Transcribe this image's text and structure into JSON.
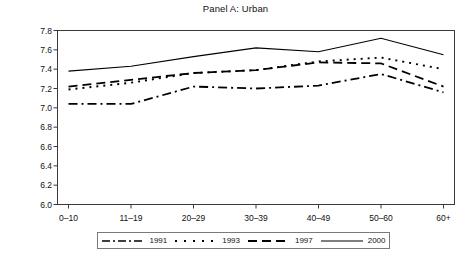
{
  "chart_data": {
    "type": "line",
    "title": "Panel A: Urban",
    "xlabel": "",
    "ylabel": "",
    "ylim": [
      6.0,
      7.8
    ],
    "yticks": [
      "6.0",
      "6.2",
      "6.4",
      "6.6",
      "6.8",
      "7.0",
      "7.2",
      "7.4",
      "7.6",
      "7.8"
    ],
    "grid": false,
    "legend_position": "bottom",
    "categories": [
      "0–10",
      "11–19",
      "20–29",
      "30–39",
      "40–49",
      "50–60",
      "60+"
    ],
    "series": [
      {
        "name": "1991",
        "style": "dash-dot",
        "color": "#000000",
        "values": [
          7.04,
          7.04,
          7.22,
          7.2,
          7.23,
          7.35,
          7.16
        ]
      },
      {
        "name": "1993",
        "style": "dotted",
        "color": "#000000",
        "values": [
          7.19,
          7.26,
          7.36,
          7.39,
          7.48,
          7.52,
          7.4
        ]
      },
      {
        "name": "1997",
        "style": "dashed",
        "color": "#000000",
        "values": [
          7.22,
          7.29,
          7.36,
          7.39,
          7.47,
          7.46,
          7.22
        ]
      },
      {
        "name": "2000",
        "style": "solid",
        "color": "#000000",
        "values": [
          7.38,
          7.43,
          7.53,
          7.62,
          7.58,
          7.72,
          7.55
        ]
      }
    ]
  },
  "legend": {
    "entries": [
      {
        "label": "1991"
      },
      {
        "label": "1993"
      },
      {
        "label": "1997"
      },
      {
        "label": "2000"
      }
    ]
  }
}
